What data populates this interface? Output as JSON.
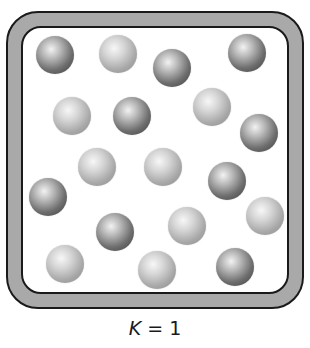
{
  "diagram": {
    "label": {
      "variable": "K",
      "equals": " = ",
      "value": "1"
    },
    "container": {
      "wall_color": "#a9a9a9",
      "outline_color": "#1a1a1a",
      "interior_color": "#ffffff"
    },
    "particles": [
      {
        "x": 55,
        "y": 55,
        "type": "dark"
      },
      {
        "x": 118,
        "y": 54,
        "type": "light"
      },
      {
        "x": 172,
        "y": 68,
        "type": "dark"
      },
      {
        "x": 247,
        "y": 53,
        "type": "dark"
      },
      {
        "x": 72,
        "y": 116,
        "type": "light"
      },
      {
        "x": 132,
        "y": 116,
        "type": "dark"
      },
      {
        "x": 212,
        "y": 107,
        "type": "light"
      },
      {
        "x": 259,
        "y": 133,
        "type": "dark"
      },
      {
        "x": 97,
        "y": 167,
        "type": "light"
      },
      {
        "x": 163,
        "y": 167,
        "type": "light"
      },
      {
        "x": 227,
        "y": 181,
        "type": "dark"
      },
      {
        "x": 48,
        "y": 197,
        "type": "dark"
      },
      {
        "x": 115,
        "y": 232,
        "type": "dark"
      },
      {
        "x": 187,
        "y": 226,
        "type": "light"
      },
      {
        "x": 265,
        "y": 216,
        "type": "light"
      },
      {
        "x": 65,
        "y": 264,
        "type": "light"
      },
      {
        "x": 157,
        "y": 270,
        "type": "light"
      },
      {
        "x": 235,
        "y": 267,
        "type": "dark"
      }
    ],
    "counts": {
      "dark": 9,
      "light": 9
    }
  }
}
